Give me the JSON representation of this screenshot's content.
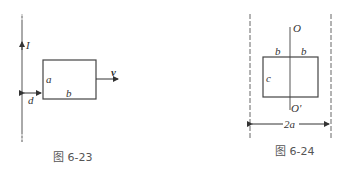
{
  "figures": [
    {
      "caption": "图 6-23",
      "labels": {
        "current": "I",
        "side_a": "a",
        "side_b": "b",
        "distance": "d",
        "velocity": "v"
      }
    },
    {
      "caption": "图 6-24",
      "labels": {
        "axis_top": "O",
        "axis_bottom": "O'",
        "half_width_left": "b",
        "half_width_right": "b",
        "height": "c",
        "separation": "2a"
      }
    }
  ]
}
